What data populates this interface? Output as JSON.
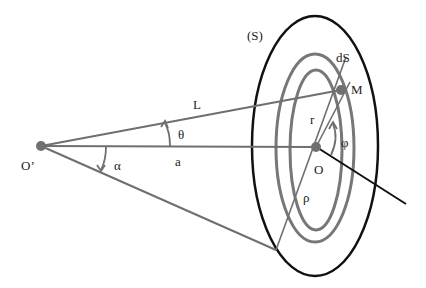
{
  "diagram": {
    "type": "geometry",
    "colors": {
      "outline": "#111111",
      "ring": "#777777",
      "line": "#6f6f6f",
      "point": "#707070"
    },
    "labels": {
      "surface": "(S)",
      "dS": "dS",
      "M": "M",
      "r": "r",
      "phi": "φ",
      "O": "O",
      "rho": "ρ",
      "L": "L",
      "theta": "θ",
      "a": "a",
      "alpha": "α",
      "O_prime": "O’"
    },
    "points": {
      "O_prime": [
        41,
        146
      ],
      "O": [
        316,
        147
      ],
      "M": [
        341,
        90
      ]
    }
  }
}
